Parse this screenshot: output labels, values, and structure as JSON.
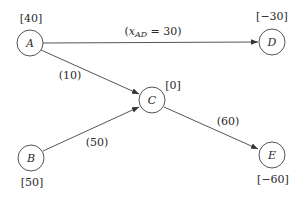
{
  "diagram": {
    "type": "network-flow",
    "colors": {
      "stroke": "#555555",
      "text": "#2a2a2a",
      "background": "#ffffff"
    },
    "nodes": [
      {
        "id": "A",
        "label": "A",
        "supply": "[40]",
        "x": 30,
        "y": 43
      },
      {
        "id": "B",
        "label": "B",
        "supply": "[50]",
        "x": 31,
        "y": 158
      },
      {
        "id": "C",
        "label": "C",
        "supply": "[0]",
        "x": 152,
        "y": 100
      },
      {
        "id": "D",
        "label": "D",
        "supply": "[−30]",
        "x": 272,
        "y": 42
      },
      {
        "id": "E",
        "label": "E",
        "supply": "[−60]",
        "x": 272,
        "y": 155
      }
    ],
    "edges": [
      {
        "from": "A",
        "to": "D",
        "label_prefix": "(",
        "var": "x",
        "sub": "AD",
        "label_suffix": " = 30)",
        "flow": 30
      },
      {
        "from": "A",
        "to": "C",
        "label": "(10)",
        "flow": 10
      },
      {
        "from": "B",
        "to": "C",
        "label": "(50)",
        "flow": 50
      },
      {
        "from": "C",
        "to": "E",
        "label": "(60)",
        "flow": 60
      }
    ]
  }
}
